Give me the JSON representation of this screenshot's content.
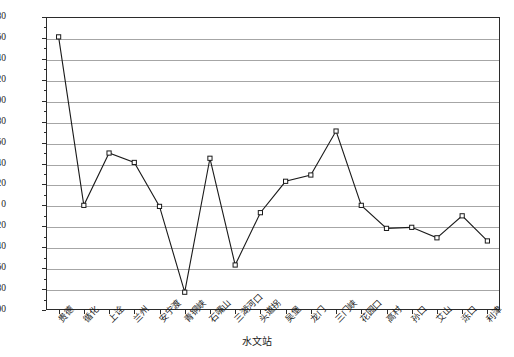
{
  "chart_data": {
    "type": "line",
    "title": "",
    "xlabel": "水文站",
    "ylabel_text": "径流量/10",
    "ylabel_sup": "8",
    "ylabel_unit": "m³",
    "ylabel_full": "径流量/10⁸m³",
    "ylim": [
      -100,
      180
    ],
    "ytick_step": 20,
    "grid": true,
    "legend": "none",
    "marker": "open-square",
    "categories": [
      "贵德",
      "循化",
      "上诠",
      "兰州",
      "安宁渡",
      "青铜峡",
      "石嘴山",
      "三湖河口",
      "头道拐",
      "吴堡",
      "龙门",
      "三门峡",
      "花园口",
      "高村",
      "孙口",
      "艾山",
      "泺口",
      "利津"
    ],
    "values": [
      161,
      0,
      50,
      41,
      -1,
      -83,
      45,
      -57,
      -7,
      23,
      29,
      71,
      0,
      -22,
      -21,
      -31,
      -10,
      -34
    ],
    "yticks": [
      180,
      160,
      140,
      120,
      100,
      80,
      60,
      40,
      20,
      0,
      -20,
      -40,
      -60,
      -80,
      -100
    ],
    "ytick_labels": [
      "180",
      "160",
      "140",
      "120",
      "100",
      "80",
      "60",
      "40",
      "20",
      "0",
      "−20",
      "−40",
      "−60",
      "−80",
      "−100"
    ],
    "colors": {
      "line": "#1a1a1a",
      "marker_face": "#ffffff",
      "marker_edge": "#1a1a1a",
      "grid": "#a6a6a6",
      "frame": "#2b2b2b",
      "background": "#ffffff"
    }
  }
}
